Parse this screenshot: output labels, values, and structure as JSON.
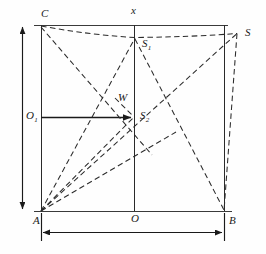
{
  "figure": {
    "type": "geometry-diagram",
    "background_color": "#fefefe",
    "stroke_color": "#1a1a1a",
    "canvas": {
      "width": 266,
      "height": 254
    }
  },
  "labels": [
    {
      "id": "C",
      "text": "C",
      "sub": "",
      "x": 41,
      "y": 14
    },
    {
      "id": "x",
      "text": "x",
      "sub": "",
      "x": 131,
      "y": 10
    },
    {
      "id": "S",
      "text": "S",
      "sub": "",
      "x": 245,
      "y": 27
    },
    {
      "id": "S1",
      "text": "S",
      "sub": "1",
      "x": 142,
      "y": 38
    },
    {
      "id": "W",
      "text": "W",
      "sub": "",
      "x": 119,
      "y": 92
    },
    {
      "id": "S2",
      "text": "S",
      "sub": "2",
      "x": 140,
      "y": 110
    },
    {
      "id": "O1",
      "text": "O",
      "sub": "1",
      "x": 24,
      "y": 111
    },
    {
      "id": "A",
      "text": "A",
      "sub": "",
      "x": 33,
      "y": 216
    },
    {
      "id": "O",
      "text": "O",
      "sub": "",
      "x": 131,
      "y": 214
    },
    {
      "id": "B",
      "text": "B",
      "sub": "",
      "x": 229,
      "y": 216
    }
  ],
  "points": {
    "A": {
      "x": 41,
      "y": 211
    },
    "B": {
      "x": 224,
      "y": 211
    },
    "C": {
      "x": 41,
      "y": 25
    },
    "D": {
      "x": 224,
      "y": 25
    },
    "O": {
      "x": 134,
      "y": 211
    },
    "O1": {
      "x": 41,
      "y": 117
    },
    "S": {
      "x": 237,
      "y": 33
    },
    "S1": {
      "x": 135,
      "y": 37
    },
    "S2": {
      "x": 134,
      "y": 117
    },
    "W": {
      "x": 117,
      "y": 100
    },
    "xtop": {
      "x": 134,
      "y": 25
    }
  },
  "solid_lines": [
    {
      "name": "top-edge",
      "x1": 34,
      "y1": 25,
      "x2": 228,
      "y2": 25
    },
    {
      "name": "left-edge",
      "x1": 41,
      "y1": 25,
      "x2": 41,
      "y2": 211
    },
    {
      "name": "right-edge",
      "x1": 224,
      "y1": 25,
      "x2": 224,
      "y2": 211
    },
    {
      "name": "bottom-edge",
      "x1": 34,
      "y1": 211,
      "x2": 231,
      "y2": 211
    },
    {
      "name": "vertical-axis-x",
      "x1": 134,
      "y1": 25,
      "x2": 134,
      "y2": 211
    },
    {
      "name": "horizontal-O1-S2",
      "x1": 41,
      "y1": 117,
      "x2": 134,
      "y2": 117
    }
  ],
  "dashed_lines": [
    {
      "name": "C-to-S1",
      "x1": 41,
      "y1": 26,
      "x2": 135,
      "y2": 37
    },
    {
      "name": "S1-to-S",
      "x1": 135,
      "y1": 37,
      "x2": 237,
      "y2": 33
    },
    {
      "name": "S-to-B",
      "x1": 237,
      "y1": 33,
      "x2": 224,
      "y2": 211
    },
    {
      "name": "A-to-S",
      "x1": 41,
      "y1": 211,
      "x2": 237,
      "y2": 33
    },
    {
      "name": "A-to-S1",
      "x1": 41,
      "y1": 211,
      "x2": 135,
      "y2": 37
    },
    {
      "name": "A-to-S2",
      "x1": 41,
      "y1": 211,
      "x2": 134,
      "y2": 117
    },
    {
      "name": "A-to-W-ext",
      "x1": 41,
      "y1": 211,
      "x2": 170,
      "y2": 128
    },
    {
      "name": "C-to-O",
      "x1": 41,
      "y1": 27,
      "x2": 148,
      "y2": 150
    },
    {
      "name": "S1-to-B",
      "x1": 135,
      "y1": 38,
      "x2": 224,
      "y2": 210
    },
    {
      "name": "W-to-S2",
      "x1": 117,
      "y1": 100,
      "x2": 134,
      "y2": 117
    }
  ],
  "arrows": {
    "vertical_measure": {
      "name": "height-dimension-arrow",
      "x": 22,
      "y1": 25,
      "y2": 211
    },
    "horizontal_measure": {
      "name": "width-dimension-arrow",
      "y": 232,
      "x1": 41,
      "x2": 224
    },
    "o1_s2_arrowhead": {
      "name": "radius-arrow",
      "x": 134,
      "y": 117
    }
  }
}
